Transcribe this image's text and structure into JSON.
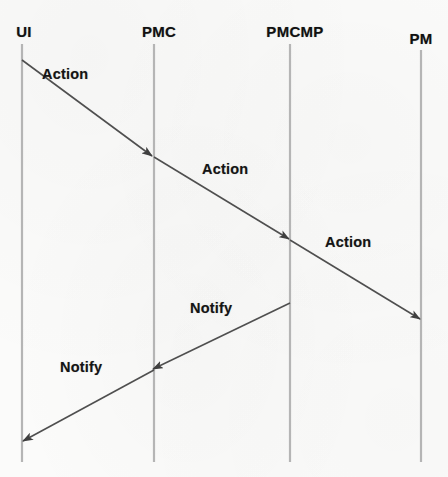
{
  "diagram": {
    "type": "uml-sequence-diagram",
    "title": "",
    "width": 448,
    "height": 477,
    "background_color": "#fbfbfa",
    "lifeline_color": "#b3b3b3",
    "message_color": "#4a4a4a",
    "text_color": "#111111",
    "lifelines": [
      {
        "id": "ui",
        "label": "UI",
        "x": 22,
        "label_x": 24,
        "label_y": 23,
        "top": 44,
        "bottom": 462
      },
      {
        "id": "pmc",
        "label": "PMC",
        "x": 154,
        "label_x": 159,
        "label_y": 23,
        "top": 44,
        "bottom": 462
      },
      {
        "id": "pmcmp",
        "label": "PMCMP",
        "x": 290,
        "label_x": 295,
        "label_y": 23,
        "top": 44,
        "bottom": 462
      },
      {
        "id": "pm",
        "label": "PM",
        "x": 421,
        "label_x": 421,
        "label_y": 30,
        "top": 50,
        "bottom": 462
      }
    ],
    "messages": [
      {
        "id": "m1",
        "label": "Action",
        "direction": "right",
        "from": "ui",
        "to": "pmc",
        "x1": 22,
        "y1": 60,
        "x2": 152,
        "y2": 156,
        "label_x": 42,
        "label_y": 66
      },
      {
        "id": "m2",
        "label": "Action",
        "direction": "right",
        "from": "pmc",
        "to": "pmcmp",
        "x1": 154,
        "y1": 157,
        "x2": 289,
        "y2": 239,
        "label_x": 202,
        "label_y": 161
      },
      {
        "id": "m3",
        "label": "Action",
        "direction": "right",
        "from": "pmcmp",
        "to": "pm",
        "x1": 290,
        "y1": 240,
        "x2": 420,
        "y2": 319,
        "label_x": 325,
        "label_y": 234
      },
      {
        "id": "m4",
        "label": "Notify",
        "direction": "left",
        "from": "pmcmp",
        "to": "pmc",
        "x1": 290,
        "y1": 303,
        "x2": 153,
        "y2": 369,
        "label_x": 190,
        "label_y": 300
      },
      {
        "id": "m5",
        "label": "Notify",
        "direction": "left",
        "from": "pmc",
        "to": "ui",
        "x1": 154,
        "y1": 370,
        "x2": 23,
        "y2": 441,
        "label_x": 60,
        "label_y": 359
      }
    ]
  }
}
